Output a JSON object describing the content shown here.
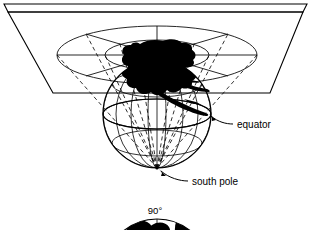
{
  "figure": {
    "background_color": "#ffffff",
    "line_color": "#000000",
    "land_fill_color": "#000000",
    "labels": [
      {
        "id": "equator",
        "text": "equator",
        "x": 237,
        "y": 125
      },
      {
        "id": "south-pole",
        "text": "south pole",
        "x": 192,
        "y": 182
      },
      {
        "id": "ninety-deg",
        "text": "90°",
        "x": 155,
        "y": 211
      }
    ],
    "plane": {
      "name": "projection-plane",
      "top_edge_y": 6,
      "band_bottom_y": 12,
      "near_edge_y": 93,
      "top_left_x": 8,
      "top_right_x": 303,
      "near_left_x": 53,
      "near_right_x": 270
    },
    "globe": {
      "name": "globe-sphere",
      "center_x": 157,
      "center_y": 114,
      "radius": 54,
      "equator_ry": 15,
      "parallels": 3,
      "meridians": 9
    },
    "plane_graticule": {
      "name": "projected-graticule",
      "center_x": 157,
      "center_y": 55,
      "rings": [
        {
          "rx": 20,
          "ry": 6
        },
        {
          "rx": 52,
          "ry": 15
        },
        {
          "rx": 100,
          "ry": 29
        }
      ],
      "radials": 8
    },
    "rays": {
      "name": "projection-rays",
      "origin_x": 157,
      "origin_y": 168,
      "style": "dashed",
      "count": 10
    },
    "bottom_figure": {
      "name": "polar-map-inset",
      "center_x": 157,
      "center_y": 272,
      "radius": 53,
      "visible_from_y": 218
    }
  }
}
